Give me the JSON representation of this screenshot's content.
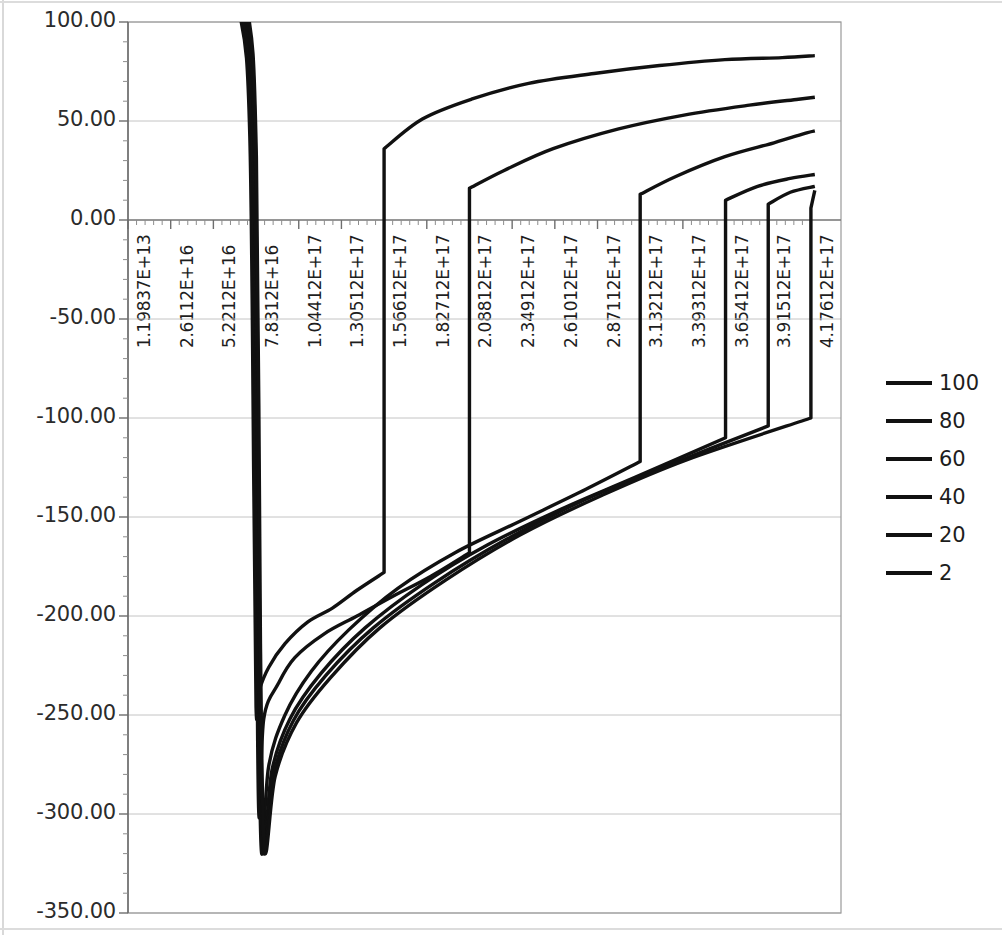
{
  "chart_data": {
    "type": "line",
    "title": "",
    "xlabel": "",
    "ylabel": "",
    "grid": true,
    "legend_position": "right",
    "ylim": [
      -350,
      100
    ],
    "y_ticks": [
      "100.00",
      "50.00",
      "0.00",
      "-50.00",
      "-100.00",
      "-150.00",
      "-200.00",
      "-250.00",
      "-300.00",
      "-350.00"
    ],
    "y_tick_values": [
      100,
      50,
      0,
      -50,
      -100,
      -150,
      -200,
      -250,
      -300,
      -350
    ],
    "x_tick_labels": [
      "1.19837E+13",
      "2.6112E+16",
      "5.2212E+16",
      "7.8312E+16",
      "1.04412E+17",
      "1.30512E+17",
      "1.56612E+17",
      "1.82712E+17",
      "2.08812E+17",
      "2.34912E+17",
      "2.61012E+17",
      "2.87112E+17",
      "3.13212E+17",
      "3.39312E+17",
      "3.65412E+17",
      "3.91512E+17",
      "4.17612E+17"
    ],
    "x_tick_values": [
      11983700000000.0,
      2.6112e+16,
      5.2212e+16,
      7.8312e+16,
      1.04412e+17,
      1.30512e+17,
      1.56612e+17,
      1.82712e+17,
      2.08812e+17,
      2.34912e+17,
      2.61012e+17,
      2.87112e+17,
      3.13212e+17,
      3.39312e+17,
      3.65412e+17,
      3.91512e+17,
      4.17612e+17
    ],
    "legend": [
      "100",
      "80",
      "60",
      "40",
      "20",
      "2"
    ],
    "series": [
      {
        "name": "100",
        "color": "#111111",
        "jump_x": 1.566e+17,
        "jump_from": -178,
        "jump_to": 36,
        "points_x": [
          1e+16,
          3e+16,
          5.5e+16,
          6.9e+16,
          7.45e+16,
          7.7e+16,
          7.83e+16,
          8e+16,
          8.6e+16,
          9.6e+16,
          1.1e+17,
          1.25e+17,
          1.4e+17,
          1.566e+17,
          1.566e+17,
          1.8e+17,
          2.1e+17,
          2.45e+17,
          2.85e+17,
          3.25e+17,
          3.65e+17,
          4e+17,
          4.2e+17
        ],
        "points_y": [
          330,
          200,
          118,
          101,
          42,
          -140,
          -246,
          -238,
          -226,
          -214,
          -203,
          -196,
          -187,
          -178,
          36,
          51,
          61,
          69,
          74,
          78,
          81,
          82,
          83
        ]
      },
      {
        "name": "80",
        "color": "#111111",
        "jump_x": 2.088e+17,
        "jump_from": -168,
        "jump_to": 16,
        "points_x": [
          1e+16,
          3e+16,
          5.5e+16,
          7e+16,
          7.6e+16,
          7.85e+16,
          8e+16,
          8.3e+16,
          9.2e+16,
          1.02e+17,
          1.2e+17,
          1.4e+17,
          1.62e+17,
          1.85e+17,
          2.088e+17,
          2.088e+17,
          2.3e+17,
          2.6e+17,
          3e+17,
          3.4e+17,
          3.8e+17,
          4.1e+17,
          4.2e+17
        ],
        "points_y": [
          330,
          205,
          122,
          103,
          40,
          -180,
          -300,
          -252,
          -234,
          -221,
          -209,
          -200,
          -190,
          -180,
          -168,
          16,
          25,
          36,
          46,
          53,
          58,
          61,
          62
        ]
      },
      {
        "name": "60",
        "color": "#111111",
        "jump_x": 3.132e+17,
        "jump_from": -122,
        "jump_to": 13,
        "points_x": [
          1e+16,
          3e+16,
          5.5e+16,
          7.1e+16,
          7.7e+16,
          7.95e+16,
          8.15e+16,
          8.6e+16,
          9.6e+16,
          1.12e+17,
          1.35e+17,
          1.65e+17,
          2e+17,
          2.4e+17,
          2.8e+17,
          3.132e+17,
          3.132e+17,
          3.35e+17,
          3.65e+17,
          3.95e+17,
          4.15e+17,
          4.2e+17
        ],
        "points_y": [
          332,
          208,
          126,
          105,
          38,
          -200,
          -318,
          -276,
          -250,
          -228,
          -207,
          -186,
          -168,
          -152,
          -136,
          -122,
          13,
          22,
          32,
          39,
          44,
          45
        ]
      },
      {
        "name": "40",
        "color": "#111111",
        "jump_x": 3.654e+17,
        "jump_from": -110,
        "jump_to": 10,
        "points_x": [
          1e+16,
          3e+16,
          5.5e+16,
          7.15e+16,
          7.75e+16,
          8e+16,
          8.25e+16,
          8.8e+16,
          9.9e+16,
          1.18e+17,
          1.45e+17,
          1.8e+17,
          2.2e+17,
          2.65e+17,
          3.1e+17,
          3.654e+17,
          3.654e+17,
          3.85e+17,
          4.05e+17,
          4.2e+17
        ],
        "points_y": [
          334,
          210,
          128,
          106,
          36,
          -208,
          -318,
          -278,
          -252,
          -229,
          -206,
          -184,
          -164,
          -146,
          -130,
          -110,
          10,
          17,
          21,
          23
        ]
      },
      {
        "name": "20",
        "color": "#111111",
        "jump_x": 3.915e+17,
        "jump_from": -104,
        "jump_to": 8,
        "points_x": [
          1e+16,
          3e+16,
          5.5e+16,
          7.2e+16,
          7.8e+16,
          8.05e+16,
          8.3e+16,
          8.9e+16,
          1.01e+17,
          1.21e+17,
          1.5e+17,
          1.88e+17,
          2.32e+17,
          2.8e+17,
          3.3e+17,
          3.915e+17,
          3.915e+17,
          4.05e+17,
          4.2e+17
        ],
        "points_y": [
          335,
          212,
          130,
          107,
          34,
          -212,
          -318,
          -280,
          -253,
          -230,
          -206,
          -183,
          -161,
          -141,
          -124,
          -104,
          8,
          14,
          17
        ]
      },
      {
        "name": "2",
        "color": "#111111",
        "jump_x": 4.176e+17,
        "jump_from": -100,
        "jump_to": 6,
        "points_x": [
          1e+16,
          3e+16,
          5.5e+16,
          7.25e+16,
          7.85e+16,
          8.1e+16,
          8.35e+16,
          9e+16,
          1.03e+17,
          1.24e+17,
          1.54e+17,
          1.94e+17,
          2.4e+17,
          2.9e+17,
          3.42e+17,
          4.176e+17,
          4.176e+17,
          4.2e+17
        ],
        "points_y": [
          336,
          214,
          132,
          108,
          32,
          -214,
          -318,
          -281,
          -254,
          -231,
          -206,
          -182,
          -159,
          -139,
          -121,
          -100,
          6,
          15
        ]
      }
    ]
  }
}
